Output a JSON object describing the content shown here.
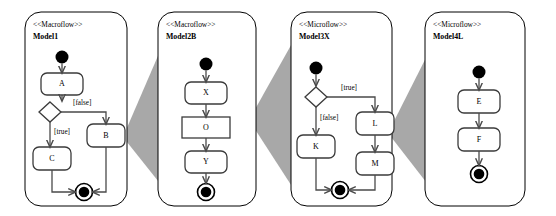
{
  "diagram": {
    "background_color": "#ffffff",
    "wedge_color": "#a8a8a8",
    "line_color": "#4a4a4a",
    "node_fill": "#ffffff"
  },
  "panels": [
    {
      "id": "panel-model1",
      "stereotype": "<<Macroflow>>",
      "name": "Model1",
      "x": 25,
      "y": 12,
      "w": 102,
      "h": 194,
      "nodes": [
        {
          "id": "n1-init",
          "kind": "initial",
          "label": "",
          "cx": 62,
          "cy": 57,
          "r": 6.5
        },
        {
          "id": "n1-a",
          "kind": "rounded",
          "label": "A",
          "x": 41,
          "y": 73,
          "w": 42,
          "h": 22
        },
        {
          "id": "n1-dec",
          "kind": "decision",
          "label": "",
          "cx": 50,
          "cy": 112,
          "rx": 11,
          "ry": 10
        },
        {
          "id": "n1-b",
          "kind": "rounded",
          "label": "B",
          "x": 87,
          "y": 124,
          "w": 38,
          "h": 23
        },
        {
          "id": "n1-c",
          "kind": "rounded",
          "label": "C",
          "x": 33,
          "y": 147,
          "w": 38,
          "h": 23
        },
        {
          "id": "n1-final",
          "kind": "final",
          "label": "",
          "cx": 84,
          "cy": 192,
          "r": 8.5
        }
      ],
      "guards": [
        {
          "id": "n1-guard-false",
          "text": "[false]",
          "x": 73,
          "y": 105
        },
        {
          "id": "n1-guard-true",
          "text": "[true]",
          "x": 54,
          "y": 134
        }
      ]
    },
    {
      "id": "panel-model2b",
      "stereotype": "<<Macroflow>>",
      "name": "Model2B",
      "x": 158,
      "y": 12,
      "w": 98,
      "h": 194,
      "nodes": [
        {
          "id": "n2-init",
          "kind": "initial",
          "label": "",
          "cx": 206,
          "cy": 64,
          "r": 6.5
        },
        {
          "id": "n2-x",
          "kind": "rounded",
          "label": "X",
          "x": 185,
          "y": 82,
          "w": 42,
          "h": 22
        },
        {
          "id": "n2-o",
          "kind": "sharp",
          "label": "O",
          "x": 182,
          "y": 117,
          "w": 48,
          "h": 21
        },
        {
          "id": "n2-y",
          "kind": "rounded",
          "label": "Y",
          "x": 185,
          "y": 151,
          "w": 42,
          "h": 22
        },
        {
          "id": "n2-final",
          "kind": "final",
          "label": "",
          "cx": 206,
          "cy": 192,
          "r": 8.5
        }
      ],
      "guards": []
    },
    {
      "id": "panel-model3x",
      "stereotype": "<<Microflow>>",
      "name": "Model3X",
      "x": 291,
      "y": 12,
      "w": 101,
      "h": 194,
      "nodes": [
        {
          "id": "n3-init",
          "kind": "initial",
          "label": "",
          "cx": 316,
          "cy": 68,
          "r": 6.5
        },
        {
          "id": "n3-dec",
          "kind": "decision",
          "label": "",
          "cx": 316,
          "cy": 97,
          "rx": 11,
          "ry": 10
        },
        {
          "id": "n3-l",
          "kind": "rounded",
          "label": "L",
          "x": 356,
          "y": 112,
          "w": 38,
          "h": 23
        },
        {
          "id": "n3-k",
          "kind": "rounded",
          "label": "K",
          "x": 297,
          "y": 135,
          "w": 38,
          "h": 23
        },
        {
          "id": "n3-m",
          "kind": "rounded",
          "label": "M",
          "x": 356,
          "y": 152,
          "w": 38,
          "h": 23
        },
        {
          "id": "n3-final",
          "kind": "final",
          "label": "",
          "cx": 340,
          "cy": 190,
          "r": 8.5
        }
      ],
      "guards": [
        {
          "id": "n3-guard-true",
          "text": "[true]",
          "x": 341,
          "y": 90
        },
        {
          "id": "n3-guard-false",
          "text": "[false]",
          "x": 320,
          "y": 120
        }
      ]
    },
    {
      "id": "panel-model4l",
      "stereotype": "<<Microflow>>",
      "name": "Model4L",
      "x": 425,
      "y": 12,
      "w": 100,
      "h": 194,
      "nodes": [
        {
          "id": "n4-init",
          "kind": "initial",
          "label": "",
          "cx": 479,
          "cy": 72,
          "r": 6.5
        },
        {
          "id": "n4-e",
          "kind": "rounded",
          "label": "E",
          "x": 458,
          "y": 90,
          "w": 42,
          "h": 23
        },
        {
          "id": "n4-f",
          "kind": "rounded",
          "label": "F",
          "x": 458,
          "y": 128,
          "w": 42,
          "h": 23
        },
        {
          "id": "n4-final",
          "kind": "final",
          "label": "",
          "cx": 479,
          "cy": 174,
          "r": 8.5
        }
      ],
      "guards": []
    }
  ],
  "wedges": [
    {
      "id": "wedge-1-2",
      "apex_x": 123,
      "apex_y": 137,
      "right_x": 170,
      "top_y": 28,
      "bottom_y": 196
    },
    {
      "id": "wedge-2-3",
      "apex_x": 249,
      "apex_y": 120,
      "right_x": 304,
      "top_y": 22,
      "bottom_y": 205
    },
    {
      "id": "wedge-3-4",
      "apex_x": 388,
      "apex_y": 133,
      "right_x": 440,
      "top_y": 30,
      "bottom_y": 200
    }
  ]
}
